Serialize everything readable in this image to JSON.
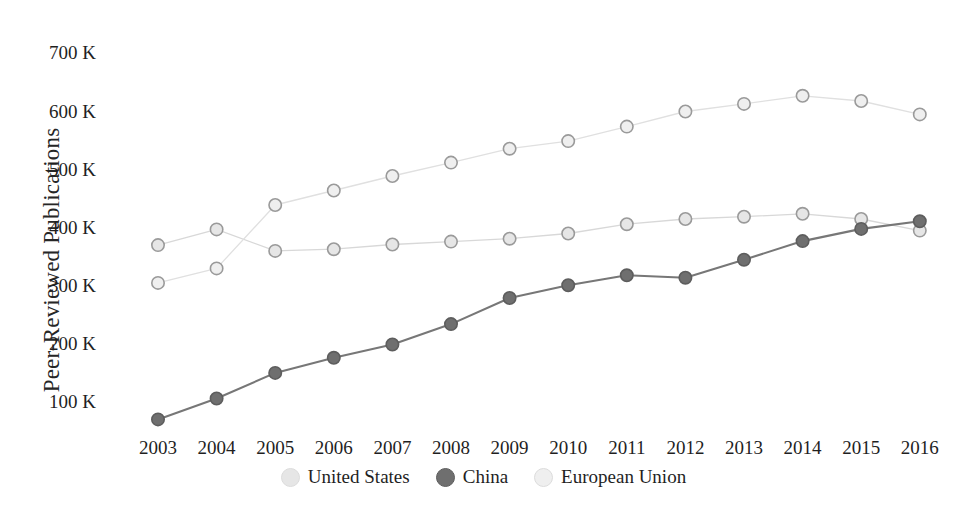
{
  "chart_data": {
    "type": "line",
    "title": "",
    "xlabel": "",
    "ylabel": "Peer-Reviewed Publications",
    "x": [
      2003,
      2004,
      2005,
      2006,
      2007,
      2008,
      2009,
      2010,
      2011,
      2012,
      2013,
      2014,
      2015,
      2016
    ],
    "categories": [
      "2003",
      "2004",
      "2005",
      "2006",
      "2007",
      "2008",
      "2009",
      "2010",
      "2011",
      "2012",
      "2013",
      "2014",
      "2015",
      "2016"
    ],
    "ylim": [
      0,
      700000
    ],
    "yticks": [
      100000,
      200000,
      300000,
      400000,
      500000,
      600000,
      700000
    ],
    "ytick_labels": [
      "100 K",
      "200 K",
      "300 K",
      "400 K",
      "500 K",
      "600 K",
      "700 K"
    ],
    "grid": false,
    "legend_position": "bottom",
    "marker": "circle-outlined",
    "series": [
      {
        "name": "United States",
        "color": "#e6e6e6",
        "line_color": "#d8d8d8",
        "values": [
          370000,
          397000,
          360000,
          363000,
          371000,
          376000,
          381000,
          390000,
          406000,
          415000,
          419000,
          424000,
          415000,
          395000
        ]
      },
      {
        "name": "China",
        "color": "#6f6f6f",
        "line_color": "#777777",
        "values": [
          70000,
          106000,
          150000,
          176000,
          199000,
          234000,
          279000,
          301000,
          318000,
          314000,
          345000,
          377000,
          398000,
          411000
        ]
      },
      {
        "name": "European Union",
        "color": "#efefef",
        "line_color": "#e0e0e0",
        "values": [
          305000,
          330000,
          439000,
          464000,
          489000,
          512000,
          536000,
          549000,
          574000,
          600000,
          613000,
          627000,
          618000,
          595000
        ]
      }
    ]
  },
  "legend": {
    "items": [
      {
        "label": "United States",
        "color": "#e6e6e6"
      },
      {
        "label": "China",
        "color": "#6f6f6f"
      },
      {
        "label": "European Union",
        "color": "#efefef"
      }
    ]
  }
}
